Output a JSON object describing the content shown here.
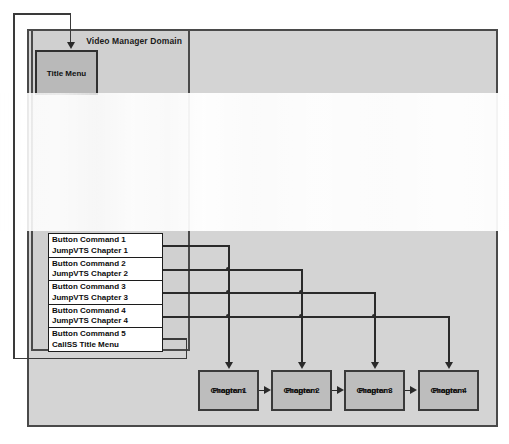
{
  "diagram": {
    "outer_domain": {
      "label": ""
    },
    "vmg_domain": {
      "label": "Video Manager Domain"
    },
    "title_menu": {
      "label": "Title Menu"
    },
    "commands": [
      {
        "line1": "Button Command 1",
        "line2": "JumpVTS Chapter 1"
      },
      {
        "line1": "Button Command 2",
        "line2": "JumpVTS Chapter 2"
      },
      {
        "line1": "Button Command 3",
        "line2": "JumpVTS Chapter 3"
      },
      {
        "line1": "Button Command 4",
        "line2": "JumpVTS Chapter 4"
      },
      {
        "line1": "Button Command 5",
        "line2": "CallSS Title Menu"
      }
    ],
    "chapters": [
      {
        "line1": "Chapter 1",
        "line2": "Program"
      },
      {
        "line1": "Chapter 2",
        "line2": "Program"
      },
      {
        "line1": "Chapter 3",
        "line2": "Program"
      },
      {
        "line1": "Chapter 4",
        "line2": "Program"
      }
    ],
    "colors": {
      "outer_fill": "#d4d4d4",
      "vmg_fill": "#d0d0d0",
      "title_menu_fill": "#b9b9b9",
      "chapter_fill": "#bdbdbd",
      "command_fill": "#ffffff",
      "stroke": "#2a2a2a",
      "page_background": "#ffffff"
    }
  }
}
